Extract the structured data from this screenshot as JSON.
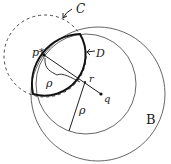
{
  "diagram": {
    "type": "geometric-circles",
    "labels": {
      "C": "C",
      "D": "D",
      "B": "B",
      "p_star": "p*",
      "r": "r",
      "q": "q",
      "rho_upper": "ρ",
      "rho_lower": "ρ"
    },
    "colors": {
      "stroke": "#222222",
      "thin_stroke": "#555555",
      "background": "#ffffff"
    },
    "elements": [
      {
        "id": "C",
        "kind": "dashed-circle",
        "cx": 45,
        "cy": 56,
        "r": 41
      },
      {
        "id": "inner",
        "kind": "circle",
        "cx": 86,
        "cy": 84,
        "r": 50
      },
      {
        "id": "B",
        "kind": "circle",
        "cx": 98,
        "cy": 94,
        "r": 67
      },
      {
        "id": "D",
        "kind": "bold-lens",
        "note": "intersection of C and inner circle"
      },
      {
        "id": "segment-pq",
        "from": "p*",
        "to": "q"
      },
      {
        "id": "segment-r-rho",
        "from": "r",
        "to": "inner circle boundary"
      }
    ]
  }
}
